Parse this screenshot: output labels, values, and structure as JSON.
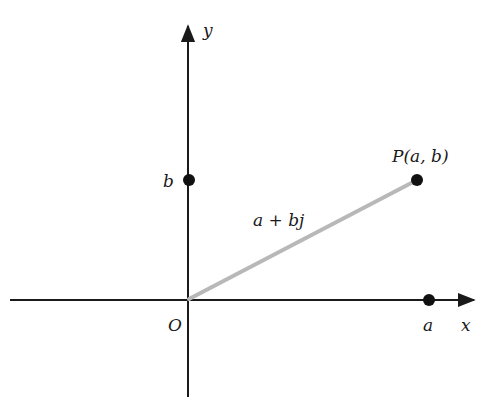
{
  "diagram": {
    "axes": {
      "x_label": "y",
      "x_axis_label": "x",
      "y_axis_label": "y",
      "origin_label": "O"
    },
    "points": {
      "P": {
        "label": "P(a, b)"
      },
      "a": {
        "label": "a"
      },
      "b": {
        "label": "b"
      }
    },
    "vector_label": "a + bj",
    "colors": {
      "axis": "#1a1a1a",
      "vector": "#b8b8b8",
      "point": "#111111"
    }
  }
}
